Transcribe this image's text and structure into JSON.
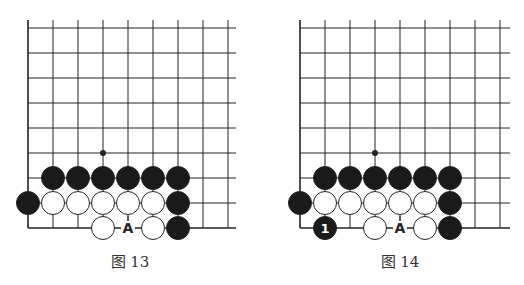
{
  "colors": {
    "line": "#222222",
    "black_stone": "#1a1a1a",
    "white_stone": "#ffffff",
    "stone_label_on_black": "#ffffff",
    "label_on_board": "#222222",
    "caption": "#333333"
  },
  "grid": {
    "cols": 9,
    "rows": 9,
    "spacing": 25
  },
  "boards": [
    {
      "caption": "图 13",
      "origin_x": 28,
      "origin_y": 28,
      "right_edge": 236,
      "star_points": [
        [
          3,
          5
        ]
      ],
      "stones": [
        {
          "color": "black",
          "col": 1,
          "row": 6
        },
        {
          "color": "black",
          "col": 2,
          "row": 6
        },
        {
          "color": "black",
          "col": 3,
          "row": 6
        },
        {
          "color": "black",
          "col": 4,
          "row": 6
        },
        {
          "color": "black",
          "col": 5,
          "row": 6
        },
        {
          "color": "black",
          "col": 6,
          "row": 6
        },
        {
          "color": "black",
          "col": 0,
          "row": 7
        },
        {
          "color": "white",
          "col": 1,
          "row": 7
        },
        {
          "color": "white",
          "col": 2,
          "row": 7
        },
        {
          "color": "white",
          "col": 3,
          "row": 7
        },
        {
          "color": "white",
          "col": 4,
          "row": 7
        },
        {
          "color": "white",
          "col": 5,
          "row": 7
        },
        {
          "color": "black",
          "col": 6,
          "row": 7
        },
        {
          "color": "white",
          "col": 3,
          "row": 8
        },
        {
          "color": "white",
          "col": 5,
          "row": 8
        },
        {
          "color": "black",
          "col": 6,
          "row": 8
        }
      ],
      "labels": [
        {
          "text": "A",
          "col": 4,
          "row": 8
        }
      ]
    },
    {
      "caption": "图 14",
      "origin_x": 300,
      "origin_y": 28,
      "right_edge": 510,
      "star_points": [
        [
          3,
          5
        ]
      ],
      "stones": [
        {
          "color": "black",
          "col": 1,
          "row": 6
        },
        {
          "color": "black",
          "col": 2,
          "row": 6
        },
        {
          "color": "black",
          "col": 3,
          "row": 6
        },
        {
          "color": "black",
          "col": 4,
          "row": 6
        },
        {
          "color": "black",
          "col": 5,
          "row": 6
        },
        {
          "color": "black",
          "col": 6,
          "row": 6
        },
        {
          "color": "black",
          "col": 0,
          "row": 7
        },
        {
          "color": "white",
          "col": 1,
          "row": 7
        },
        {
          "color": "white",
          "col": 2,
          "row": 7
        },
        {
          "color": "white",
          "col": 3,
          "row": 7
        },
        {
          "color": "white",
          "col": 4,
          "row": 7
        },
        {
          "color": "white",
          "col": 5,
          "row": 7
        },
        {
          "color": "black",
          "col": 6,
          "row": 7
        },
        {
          "color": "black",
          "col": 1,
          "row": 8,
          "number": "1"
        },
        {
          "color": "white",
          "col": 3,
          "row": 8
        },
        {
          "color": "white",
          "col": 5,
          "row": 8
        },
        {
          "color": "black",
          "col": 6,
          "row": 8
        }
      ],
      "labels": [
        {
          "text": "A",
          "col": 4,
          "row": 8
        }
      ]
    }
  ]
}
